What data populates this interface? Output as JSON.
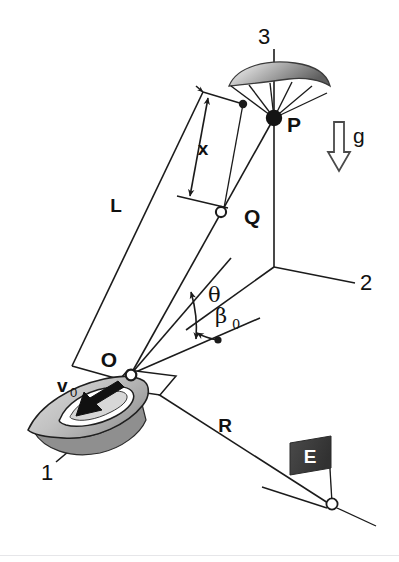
{
  "figure": {
    "type": "technical-diagram",
    "background_color": "#ffffff",
    "ink_color": "#1b1b1b"
  },
  "axes": [
    {
      "id": "1",
      "label": "1",
      "direction": "down-left",
      "description": "body axis 1 along boat heading"
    },
    {
      "id": "2",
      "label": "2",
      "direction": "down-right",
      "description": "horizontal axis 2"
    },
    {
      "id": "3",
      "label": "3",
      "direction": "up-vertical",
      "description": "vertical axis 3 through point P"
    }
  ],
  "points": [
    {
      "id": "P",
      "label": "P",
      "marker": "filled-circle",
      "description": "parafoil confluence point"
    },
    {
      "id": "Q",
      "label": "Q",
      "marker": "open-circle",
      "description": "intermediate point on tow line at distance x from top"
    },
    {
      "id": "O",
      "label": "O",
      "marker": "open-circle",
      "description": "origin at boat / tow attachment"
    }
  ],
  "dimensions": [
    {
      "id": "L",
      "label": "L",
      "description": "full tow line length from O to canopy top"
    },
    {
      "id": "x",
      "label": "x",
      "description": "distance measured down from top to Q",
      "arrow": "double-headed"
    },
    {
      "id": "R",
      "label": "R",
      "description": "ground range from O to the E marker base"
    }
  ],
  "angles": [
    {
      "id": "theta",
      "label": "θ",
      "description": "angle between tow line OP and reference line",
      "arrow": "double-headed-arc"
    },
    {
      "id": "beta0",
      "label": "β",
      "subscript": "0",
      "description": "initial azimuth angle at O",
      "arrow": "single-arc"
    }
  ],
  "vectors": [
    {
      "id": "g",
      "label": "g",
      "direction": "down",
      "style": "hollow-outline-arrow",
      "description": "gravitational acceleration"
    },
    {
      "id": "v0",
      "label": "v",
      "subscript": "0",
      "direction": "down-left",
      "style": "solid-black-arrow",
      "description": "boat velocity"
    }
  ],
  "objects": [
    {
      "id": "canopy",
      "name": "parafoil-canopy",
      "shape": "crescent-ellipse",
      "fill": "grey-gradient",
      "lines": 6,
      "description": "shaded canopy with suspension lines converging at P"
    },
    {
      "id": "boat",
      "name": "boat",
      "fill": "grey",
      "description": "hull with white cockpit outline and velocity arrow"
    },
    {
      "id": "marker",
      "name": "flag-marker",
      "label": "E",
      "flag_fill": "#3b3b3b",
      "text_color": "#ffffff",
      "description": "dark flag with white E on a pole over an open-circle ground node"
    }
  ],
  "colors": {
    "ink": "#1b1b1b",
    "flag": "#3b3b3b",
    "canopy_light": "#f2f2f2",
    "canopy_dark": "#6e6e6e",
    "boat_hull": "#c9c9c9",
    "boat_shadow": "#8a8a8a"
  }
}
